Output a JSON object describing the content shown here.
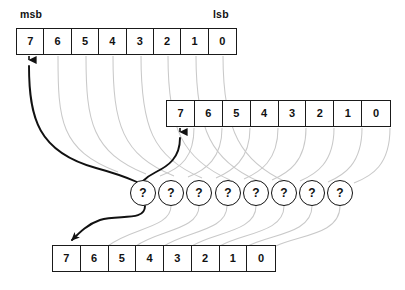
{
  "diagram": {
    "end_labels": {
      "msb": "msb",
      "lsb": "lsb"
    },
    "bit_labels": [
      "7",
      "6",
      "5",
      "4",
      "3",
      "2",
      "1",
      "0"
    ],
    "unknown_symbol": "?",
    "rows": [
      {
        "name": "top-byte",
        "bits": [
          "7",
          "6",
          "5",
          "4",
          "3",
          "2",
          "1",
          "0"
        ],
        "x": 16,
        "y": 28,
        "width": 221,
        "height": 27
      },
      {
        "name": "middle-byte",
        "bits": [
          "7",
          "6",
          "5",
          "4",
          "3",
          "2",
          "1",
          "0"
        ],
        "x": 166,
        "y": 100,
        "width": 225,
        "height": 27
      },
      {
        "name": "bottom-byte",
        "bits": [
          "7",
          "6",
          "5",
          "4",
          "3",
          "2",
          "1",
          "0"
        ],
        "x": 52,
        "y": 245,
        "width": 224,
        "height": 27
      }
    ],
    "nodes": {
      "name": "unknown-operation-nodes",
      "count": 8,
      "labels": [
        "?",
        "?",
        "?",
        "?",
        "?",
        "?",
        "?",
        "?"
      ],
      "first_center_x": 143,
      "center_y": 193,
      "spacing": 28.2,
      "radius": 13
    },
    "colors": {
      "stroke": "#111111",
      "faint_wire": "#c9c9c9",
      "background": "#ffffff"
    }
  }
}
